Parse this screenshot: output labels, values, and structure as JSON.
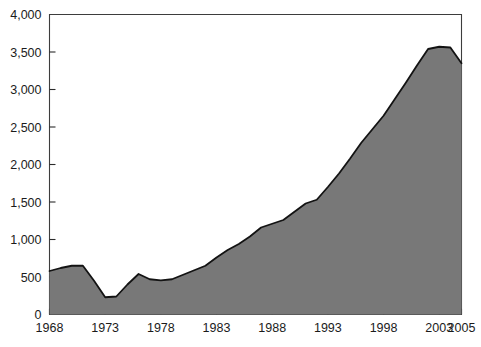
{
  "chart_data": {
    "type": "area",
    "title": "",
    "subtitle": "",
    "xlabel": "",
    "ylabel": "",
    "xlim": [
      1968,
      2005
    ],
    "ylim": [
      0,
      4000
    ],
    "grid": false,
    "legend": null,
    "fill_color": "#787878",
    "line_color": "#131313",
    "axis_color": "#3d3d3d",
    "y_ticks": [
      0,
      500,
      1000,
      1500,
      2000,
      2500,
      3000,
      3500,
      4000
    ],
    "y_tick_labels": [
      "0",
      "500",
      "1,000",
      "1,500",
      "2,000",
      "2,500",
      "3,000",
      "3,500",
      "4,000"
    ],
    "x_ticks": [
      1968,
      1973,
      1978,
      1983,
      1988,
      1993,
      1998,
      2003,
      2005
    ],
    "x_tick_labels": [
      "1968",
      "1973",
      "1978",
      "1983",
      "1988",
      "1993",
      "1998",
      "2003",
      "2005"
    ],
    "x": [
      1968,
      1969,
      1970,
      1971,
      1972,
      1973,
      1974,
      1975,
      1976,
      1977,
      1978,
      1979,
      1980,
      1981,
      1982,
      1983,
      1984,
      1985,
      1986,
      1987,
      1988,
      1989,
      1990,
      1991,
      1992,
      1993,
      1994,
      1995,
      1996,
      1997,
      1998,
      1999,
      2000,
      2001,
      2002,
      2003,
      2004,
      2005
    ],
    "values": [
      580,
      620,
      650,
      650,
      450,
      230,
      240,
      400,
      540,
      470,
      455,
      470,
      530,
      590,
      650,
      760,
      860,
      940,
      1040,
      1160,
      1210,
      1260,
      1370,
      1480,
      1530,
      1700,
      1880,
      2080,
      2290,
      2470,
      2650,
      2870,
      3090,
      3320,
      3540,
      3570,
      3560,
      3350
    ],
    "series_name": ""
  }
}
